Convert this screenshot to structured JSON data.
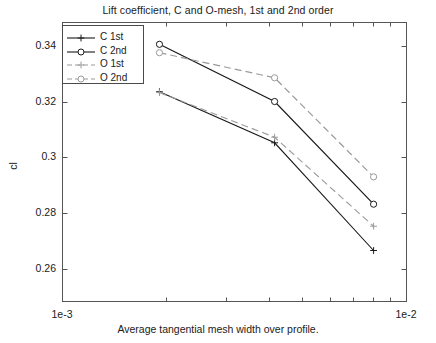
{
  "chart_data": {
    "type": "line",
    "title": "Lift coefficient, C and O-mesh, 1st and 2nd order",
    "xlabel": "Average tangential mesh width over profile.",
    "ylabel": "cl",
    "xscale": "log",
    "xlim": [
      0.001,
      0.01
    ],
    "ylim": [
      0.2485,
      0.3485
    ],
    "grid": false,
    "legend_position": "top-left",
    "xticklabels": [
      "1e-3",
      "1e-2"
    ],
    "xtickvalues": [
      0.001,
      0.01
    ],
    "x_minor_ticks": [
      0.002,
      0.003,
      0.004,
      0.005,
      0.006,
      0.007,
      0.008,
      0.009
    ],
    "yticklabels": [
      "0.26",
      "0.28",
      "0.3",
      "0.32",
      "0.34"
    ],
    "ytickvalues": [
      0.26,
      0.28,
      0.3,
      0.32,
      0.34
    ],
    "x": [
      0.00192,
      0.00415,
      0.00805
    ],
    "series": [
      {
        "name": "C 1st",
        "color": "#1a1a1a",
        "linestyle": "solid",
        "marker": "plus",
        "values": [
          0.3235,
          0.3052,
          0.2666
        ]
      },
      {
        "name": "C 2nd",
        "color": "#1a1a1a",
        "linestyle": "solid",
        "marker": "circle",
        "values": [
          0.3405,
          0.32,
          0.2832
        ]
      },
      {
        "name": "O 1st",
        "color": "#9a9a9a",
        "linestyle": "dashed",
        "marker": "plus",
        "values": [
          0.3232,
          0.3072,
          0.2753
        ]
      },
      {
        "name": "O 2nd",
        "color": "#9a9a9a",
        "linestyle": "dashed",
        "marker": "circle",
        "values": [
          0.3375,
          0.3285,
          0.293
        ]
      }
    ]
  },
  "legend": {
    "items": [
      {
        "label": "C 1st"
      },
      {
        "label": "C 2nd"
      },
      {
        "label": "O 1st"
      },
      {
        "label": "O 2nd"
      }
    ]
  }
}
